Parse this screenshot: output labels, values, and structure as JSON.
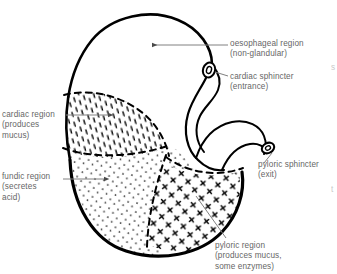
{
  "diagram": {
    "background_color": "#ffffff",
    "outline_color": "#000000",
    "text_color": "#666666",
    "leader_color": "#808080",
    "labels": {
      "oesophageal_region": "oesophageal region\n(non-glandular)",
      "cardiac_sphincter": "cardiac sphincter\n(entrance)",
      "cardiac_region": "cardiac region\n(produces\nmucus)",
      "fundic_region": "fundic region\n(secretes\nacid)",
      "pyloric_sphincter": "pyloric sphincter\n(exit)",
      "pyloric_region": "pyloric region\n(produces mucus,\nsome enzymes)"
    },
    "edge_clipped_glyphs": {
      "upper_right": "s",
      "lower_right": "t"
    },
    "regions": [
      {
        "name": "oesophageal region",
        "fill_pattern": "none",
        "note": "non-glandular"
      },
      {
        "name": "cardiac region",
        "fill_pattern": "short-dashes",
        "note": "produces mucus"
      },
      {
        "name": "fundic region",
        "fill_pattern": "fine-dots",
        "note": "secretes acid"
      },
      {
        "name": "pyloric region",
        "fill_pattern": "crosses",
        "note": "produces mucus, some enzymes"
      }
    ],
    "structures": [
      {
        "name": "cardiac sphincter",
        "shape": "small oval ring",
        "note": "entrance"
      },
      {
        "name": "pyloric sphincter",
        "shape": "small oval ring",
        "note": "exit"
      }
    ]
  }
}
